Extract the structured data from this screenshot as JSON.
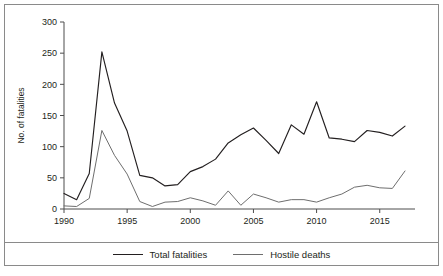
{
  "chart_data": {
    "type": "line",
    "title": "",
    "xlabel": "",
    "ylabel": "No. of fatalities",
    "xlim": [
      1990,
      2017
    ],
    "ylim": [
      0,
      300
    ],
    "grid": false,
    "legend_position": "bottom",
    "x": [
      1990,
      1991,
      1992,
      1993,
      1994,
      1995,
      1996,
      1997,
      1998,
      1999,
      2000,
      2001,
      2002,
      2003,
      2004,
      2005,
      2006,
      2007,
      2008,
      2009,
      2010,
      2011,
      2012,
      2013,
      2014,
      2015,
      2016,
      2017
    ],
    "xticks": [
      1990,
      1995,
      2000,
      2005,
      2010,
      2015
    ],
    "xtick_labels": [
      "1990",
      "1995",
      "2000",
      "2005",
      "2010",
      "2015"
    ],
    "yticks": [
      0,
      50,
      100,
      150,
      200,
      250,
      300
    ],
    "ytick_labels": [
      "0",
      "50",
      "100",
      "150",
      "200",
      "250",
      "300"
    ],
    "series": [
      {
        "name": "Total fatalities",
        "color": "#231f20",
        "values": [
          25,
          15,
          57,
          252,
          170,
          125,
          54,
          50,
          37,
          39,
          60,
          68,
          80,
          106,
          119,
          130,
          110,
          89,
          135,
          120,
          172,
          114,
          112,
          108,
          126,
          123,
          117,
          133
        ]
      },
      {
        "name": "Hostile deaths",
        "color": "#6e6e6e",
        "values": [
          5,
          4,
          17,
          126,
          86,
          56,
          12,
          4,
          11,
          12,
          18,
          13,
          6,
          29,
          6,
          24,
          18,
          11,
          15,
          15,
          11,
          18,
          24,
          35,
          38,
          34,
          33,
          61
        ]
      }
    ]
  },
  "axes": {
    "ylabel": "No. of fatalities"
  },
  "legend": {
    "items": [
      {
        "label": "Total fatalities",
        "style": "dark"
      },
      {
        "label": "Hostile deaths",
        "style": "light"
      }
    ]
  }
}
